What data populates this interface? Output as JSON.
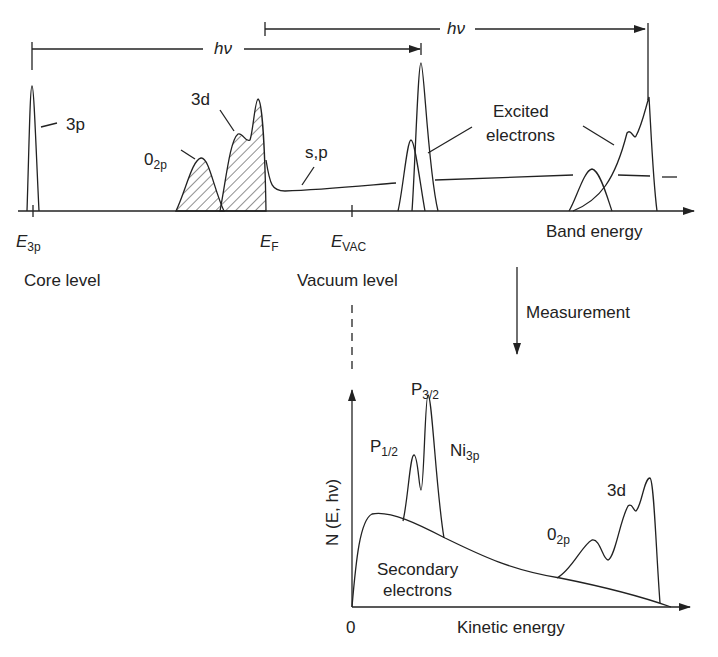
{
  "figure": {
    "top_panel": {
      "axis_label": "Band energy",
      "photon_arrow_1": "hν",
      "photon_arrow_2": "hν",
      "peaks": {
        "core": "3p",
        "o2p_main": "0",
        "o2p_sub": "2p",
        "d_band": "3d",
        "sp_band": "s,p",
        "excited_line1": "Excited",
        "excited_line2": "electrons"
      },
      "ticks": {
        "e3p_main": "E",
        "e3p_sub": "3p",
        "ef_main": "E",
        "ef_sub": "F",
        "evac_main": "E",
        "evac_sub": "VAC"
      },
      "captions": {
        "core_level": "Core level",
        "vacuum_level": "Vacuum level"
      }
    },
    "measurement_label": "Measurement",
    "bottom_panel": {
      "y_axis_label": "N (E, hν)",
      "x_axis_label": "Kinetic energy",
      "origin": "0",
      "peaks": {
        "p12_main": "P",
        "p12_sub": "1/2",
        "p32_main": "P",
        "p32_sub": "3/2",
        "ni_main": "Ni",
        "ni_sub": "3p",
        "o2p_main": "0",
        "o2p_sub": "2p",
        "d_band": "3d",
        "secondary_line1": "Secondary",
        "secondary_line2": "electrons"
      }
    }
  }
}
